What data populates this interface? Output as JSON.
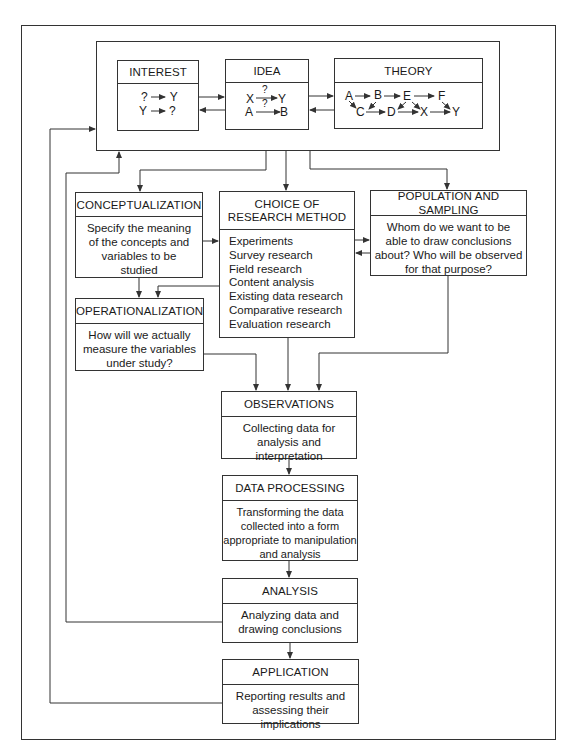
{
  "diagram": {
    "top_group": {
      "interest": {
        "label": "INTEREST",
        "lines": [
          "? → Y",
          "Y → ?"
        ],
        "rows": [
          {
            "from": "?",
            "to": "Y"
          },
          {
            "from": "Y",
            "to": "?"
          }
        ]
      },
      "idea": {
        "label": "IDEA",
        "rows": [
          {
            "from": "X",
            "mark": "?",
            "to": "Y"
          },
          {
            "from": "A",
            "mark": "?",
            "to": "B"
          }
        ]
      },
      "theory": {
        "label": "THEORY",
        "row1": [
          "A",
          "B",
          "E",
          "F"
        ],
        "row2": [
          "C",
          "D",
          "X",
          "Y"
        ]
      }
    },
    "conceptualization": {
      "label": "CONCEPTUALIZATION",
      "text": [
        "Specify the meaning",
        "of the concepts and",
        "variables to be",
        "studied"
      ]
    },
    "choice_of_method": {
      "label_lines": [
        "CHOICE OF",
        "RESEARCH METHOD"
      ],
      "items": [
        "Experiments",
        "Survey research",
        "Field research",
        "Content analysis",
        "Existing data research",
        "Comparative research",
        "Evaluation research"
      ]
    },
    "population_sampling": {
      "label": "POPULATION AND SAMPLING",
      "text": [
        "Whom do we want to be",
        "able to draw conclusions",
        "about?  Who will be observed",
        "for that purpose?"
      ]
    },
    "operationalization": {
      "label": "OPERATIONALIZATION",
      "text": [
        "How will we actually",
        "measure the variables",
        "under study?"
      ]
    },
    "observations": {
      "label": "OBSERVATIONS",
      "text": [
        "Collecting data for",
        "analysis and interpretation"
      ]
    },
    "data_processing": {
      "label": "DATA PROCESSING",
      "text": [
        "Transforming the data",
        "collected into a form",
        "appropriate to manipulation",
        "and analysis"
      ]
    },
    "analysis": {
      "label": "ANALYSIS",
      "text": [
        "Analyzing data and",
        "drawing conclusions"
      ]
    },
    "application": {
      "label": "APPLICATION",
      "text": [
        "Reporting results and",
        "assessing their implications"
      ]
    },
    "colors": {
      "line": "#333333",
      "background": "#ffffff",
      "text": "#1a1a1a"
    }
  }
}
